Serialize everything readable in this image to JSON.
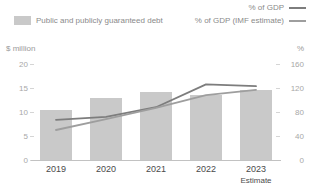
{
  "legend": {
    "bar_entry": {
      "label": "Public and publicly guaranteed debt",
      "color": "#c9c9c9"
    },
    "line_entries": [
      {
        "label": "% of GDP",
        "color": "#7d7d7d"
      },
      {
        "label": "% of GDP (IMF estimate)",
        "color": "#9e9e9e"
      }
    ]
  },
  "axes": {
    "left_title": "$ million",
    "right_title": "%",
    "left_ticks": [
      "20",
      "15",
      "10",
      "5",
      "0"
    ],
    "right_ticks": [
      "160",
      "120",
      "80",
      "40",
      "0"
    ]
  },
  "xaxis": {
    "labels": [
      "2019",
      "2020",
      "2021",
      "2022",
      "2023"
    ],
    "sublabels": [
      "",
      "",
      "",
      "",
      "Estimate"
    ]
  },
  "chart_data": {
    "type": "bar",
    "title": "",
    "subtitle": "",
    "categories": [
      "2019",
      "2020",
      "2021",
      "2022",
      "2023"
    ],
    "xlabel": "",
    "ylabel": "$ million",
    "y2label": "%",
    "ylim": [
      0,
      20
    ],
    "y2lim": [
      0,
      160
    ],
    "grid": false,
    "legend_position": "top",
    "series": [
      {
        "name": "Public and publicly guaranteed debt",
        "type": "bar",
        "axis": "left",
        "unit": "$ million",
        "color": "#c9c9c9",
        "values": [
          10.5,
          13.0,
          14.2,
          13.5,
          14.5
        ]
      },
      {
        "name": "% of GDP",
        "type": "line",
        "axis": "right",
        "unit": "%",
        "color": "#7d7d7d",
        "values": [
          67,
          72,
          88,
          126,
          123
        ]
      },
      {
        "name": "% of GDP (IMF estimate)",
        "type": "line",
        "axis": "right",
        "unit": "%",
        "color": "#9e9e9e",
        "values": [
          50,
          68,
          87,
          108,
          117
        ]
      }
    ],
    "annotations": [
      "Estimate"
    ]
  }
}
